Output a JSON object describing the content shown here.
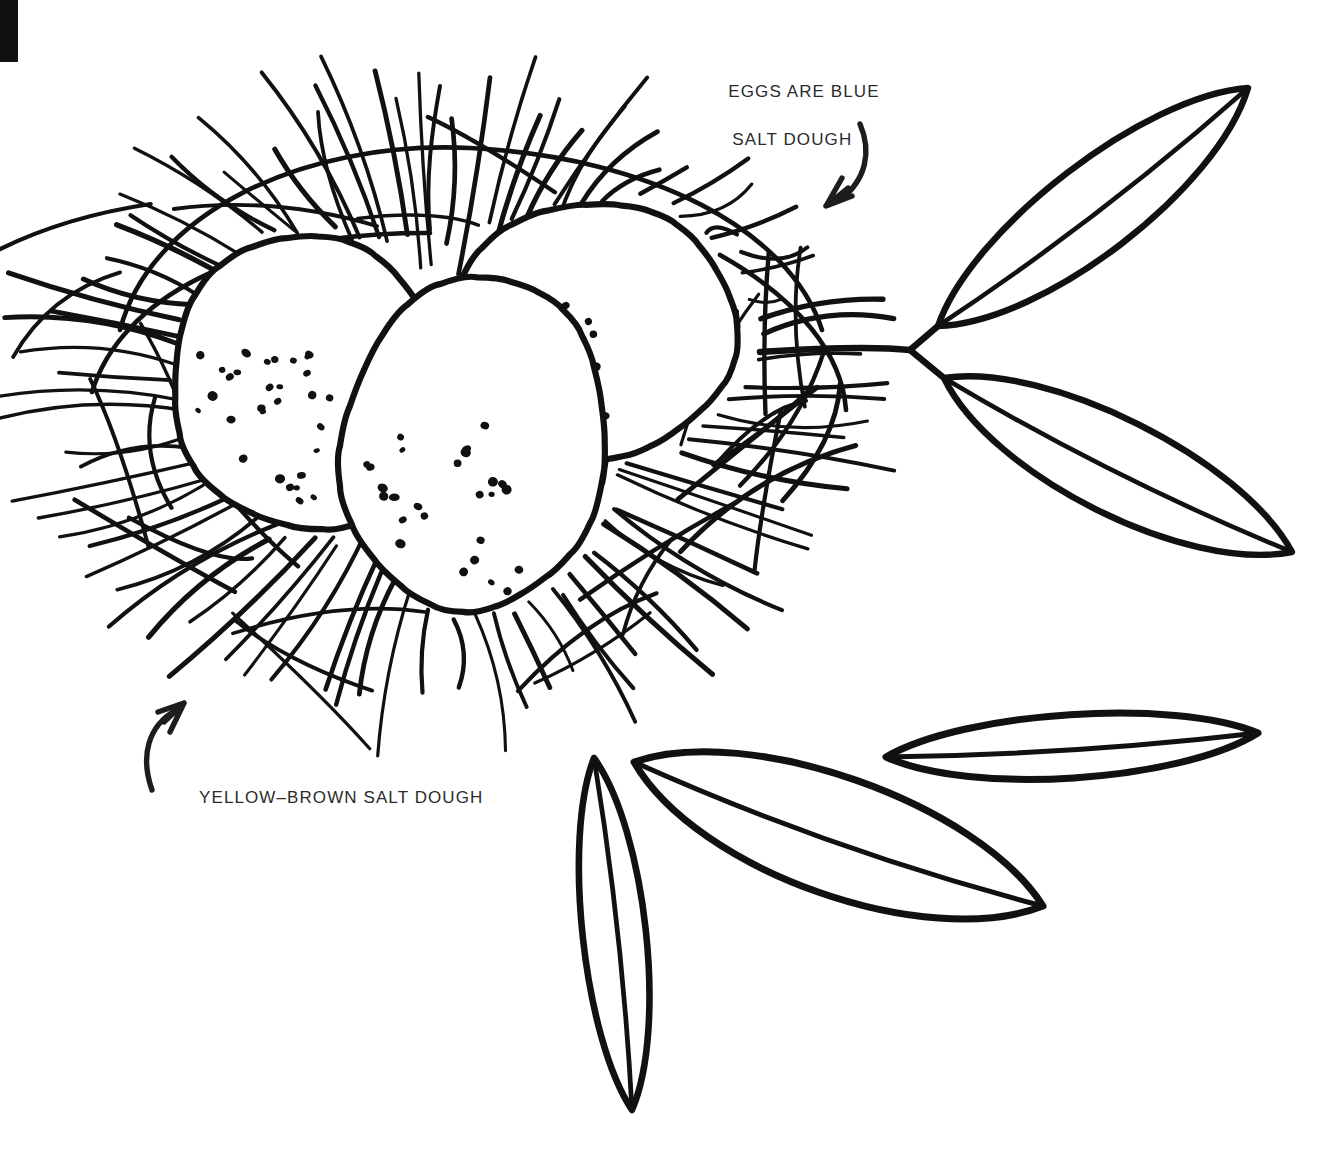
{
  "page": {
    "background_color": "#ffffff",
    "ink_color": "#111111",
    "text_color": "#2b2b2b",
    "width": 1333,
    "height": 1156
  },
  "corner_mark": {
    "name": "black-corner-bar",
    "color": "#111111"
  },
  "annotations": [
    {
      "id": "eggs",
      "line1": "EGGS ARE BLUE",
      "line2": "SALT DOUGH",
      "arrow": "curved-arrow-down-left",
      "target": "eggs-in-nest"
    },
    {
      "id": "nest",
      "line1": "YELLOW–BROWN SALT DOUGH",
      "line2": "",
      "arrow": "curved-arrow-up-right",
      "target": "nest-straw"
    }
  ],
  "illustration": {
    "nest": {
      "name": "birds-nest",
      "straw_count": 86,
      "center_x": 440,
      "center_y": 400,
      "radius_x": 390,
      "radius_y": 300
    },
    "eggs": [
      {
        "name": "egg-left",
        "cx": 322,
        "cy": 380,
        "rx": 138,
        "ry": 148,
        "rotate": -14,
        "speckles": 30
      },
      {
        "name": "egg-back-right",
        "cx": 604,
        "cy": 330,
        "rx": 148,
        "ry": 128,
        "rotate": -8,
        "speckles": 22
      },
      {
        "name": "egg-front",
        "cx": 487,
        "cy": 446,
        "rx": 133,
        "ry": 168,
        "rotate": 8,
        "speckles": 26
      }
    ],
    "branch_right": {
      "name": "leaf-branch-right",
      "junction_x": 910,
      "junction_y": 350,
      "stem_start_x": 760,
      "stem_start_y": 352,
      "leaves": [
        {
          "name": "leaf-upper-right",
          "tip_x": 1248,
          "tip_y": 88,
          "base_x": 938,
          "base_y": 326
        },
        {
          "name": "leaf-lower-right",
          "tip_x": 1292,
          "tip_y": 552,
          "base_x": 944,
          "base_y": 378
        }
      ]
    },
    "loose_leaves": [
      {
        "name": "leaf-vertical",
        "tip_x": 594,
        "tip_y": 758,
        "base_x": 632,
        "base_y": 1110
      },
      {
        "name": "leaf-diagonal",
        "tip_x": 1043,
        "tip_y": 906,
        "base_x": 634,
        "base_y": 762
      },
      {
        "name": "leaf-horizontal",
        "tip_x": 1258,
        "tip_y": 733,
        "base_x": 886,
        "base_y": 757
      }
    ]
  }
}
